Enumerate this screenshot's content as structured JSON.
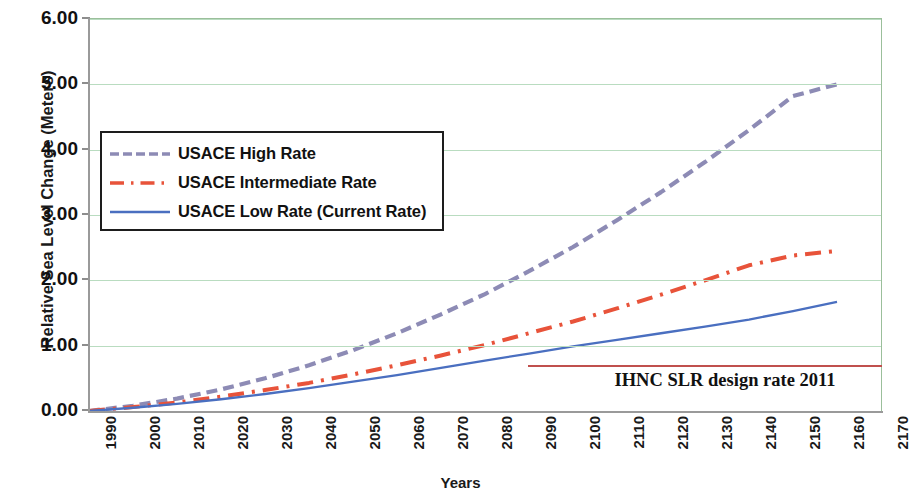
{
  "chart_data": {
    "type": "line",
    "title": "",
    "xlabel": "Years",
    "ylabel": "Relative Sea Level Change (Meters)",
    "y2label": "Relative Sea Level Rise (Feet)",
    "xlim": [
      1990,
      2170
    ],
    "ylim": [
      0.0,
      6.0
    ],
    "grid": true,
    "legend_position": "upper-left-inside",
    "x_tick_labels": [
      "1990",
      "2000",
      "2010",
      "2020",
      "2030",
      "2040",
      "2050",
      "2060",
      "2070",
      "2080",
      "2090",
      "2100",
      "2110",
      "2120",
      "2130",
      "2140",
      "2150",
      "2160",
      "2170"
    ],
    "y_tick_labels": [
      "0.00",
      "1.00",
      "2.00",
      "3.00",
      "4.00",
      "5.00",
      "6.00"
    ],
    "y_tick_values": [
      0.0,
      1.0,
      2.0,
      3.0,
      4.0,
      5.0,
      6.0
    ],
    "y2_tick_labels": [
      "3'",
      "6'",
      "9'",
      "12'"
    ],
    "y2_tick_values": [
      0.9144,
      1.8288,
      2.7432,
      3.6576
    ],
    "x": [
      1990,
      2000,
      2010,
      2020,
      2030,
      2040,
      2050,
      2060,
      2070,
      2080,
      2090,
      2100,
      2110,
      2120,
      2130,
      2140,
      2150,
      2160,
      2170
    ],
    "series": [
      {
        "name": "USACE High Rate",
        "color": "#8d8bb5",
        "style": "dashed",
        "values": [
          0.0,
          0.08,
          0.19,
          0.33,
          0.5,
          0.7,
          0.93,
          1.19,
          1.48,
          1.79,
          2.14,
          2.51,
          2.92,
          3.35,
          3.81,
          4.3,
          4.82,
          5.0,
          null
        ]
      },
      {
        "name": "USACE Intermediate Rate",
        "color": "#e8533a",
        "style": "dash-dot",
        "values": [
          0.0,
          0.06,
          0.13,
          0.22,
          0.32,
          0.43,
          0.56,
          0.7,
          0.85,
          1.01,
          1.19,
          1.37,
          1.57,
          1.78,
          2.0,
          2.23,
          2.38,
          2.45,
          null
        ]
      },
      {
        "name": "USACE Low Rate (Current Rate)",
        "color": "#4a6fc0",
        "style": "solid",
        "values": [
          0.0,
          0.05,
          0.11,
          0.18,
          0.26,
          0.35,
          0.45,
          0.55,
          0.66,
          0.77,
          0.88,
          0.99,
          1.09,
          1.19,
          1.29,
          1.4,
          1.53,
          1.67,
          null
        ]
      }
    ],
    "annotations": [
      {
        "name": "ihnc-design-rate",
        "label": "IHNC SLR design rate 2011",
        "color": "#c0504d",
        "y_value": 0.76,
        "x_start": 2090,
        "x_end": 2170
      }
    ]
  },
  "legend": {
    "entries": [
      {
        "label": "USACE High Rate"
      },
      {
        "label": "USACE Intermediate Rate"
      },
      {
        "label": "USACE Low Rate (Current Rate)"
      }
    ]
  },
  "axes": {
    "y_title": "Relative Sea Level Change (Meters)",
    "y2_title": "Relative Sea Level Rise (Feet)",
    "x_title": "Years"
  },
  "colors": {
    "high": "#8d8bb5",
    "intermediate": "#e8533a",
    "low": "#4a6fc0",
    "annotation": "#c0504d",
    "grid": "#b9dcc0",
    "frame": "#9bbf9b"
  }
}
